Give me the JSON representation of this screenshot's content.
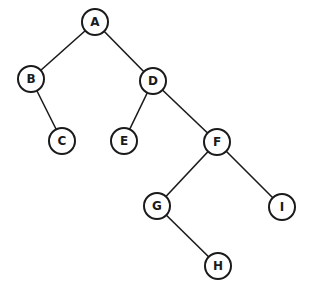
{
  "diagram": {
    "type": "binary-tree",
    "nodes": [
      {
        "id": "A",
        "label": "A",
        "x": 95,
        "y": 22
      },
      {
        "id": "B",
        "label": "B",
        "x": 31,
        "y": 79
      },
      {
        "id": "C",
        "label": "C",
        "x": 62,
        "y": 141
      },
      {
        "id": "D",
        "label": "D",
        "x": 153,
        "y": 81
      },
      {
        "id": "E",
        "label": "E",
        "x": 124,
        "y": 141
      },
      {
        "id": "F",
        "label": "F",
        "x": 217,
        "y": 142
      },
      {
        "id": "G",
        "label": "G",
        "x": 157,
        "y": 206
      },
      {
        "id": "I",
        "label": "I",
        "x": 282,
        "y": 207
      },
      {
        "id": "H",
        "label": "H",
        "x": 218,
        "y": 266
      }
    ],
    "edges": [
      {
        "from": "A",
        "to": "B"
      },
      {
        "from": "A",
        "to": "D"
      },
      {
        "from": "B",
        "to": "C"
      },
      {
        "from": "D",
        "to": "E"
      },
      {
        "from": "D",
        "to": "F"
      },
      {
        "from": "F",
        "to": "G"
      },
      {
        "from": "F",
        "to": "I"
      },
      {
        "from": "G",
        "to": "H"
      }
    ],
    "colors": {
      "stroke": "#1a1a1a",
      "background": "#ffffff"
    }
  }
}
